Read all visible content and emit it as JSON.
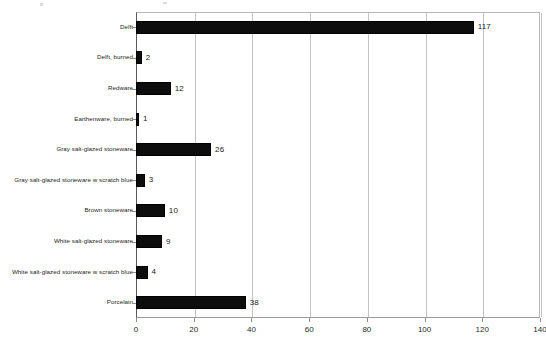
{
  "chart_data": {
    "type": "bar",
    "orientation": "horizontal",
    "title": "",
    "subtitle": "",
    "xlabel": "",
    "ylabel": "",
    "xlim": [
      0,
      140
    ],
    "xticks": [
      0,
      20,
      40,
      60,
      80,
      100,
      120,
      140
    ],
    "xtick_labels": [
      "0",
      "20",
      "40",
      "60",
      "80",
      "100",
      "120",
      "140"
    ],
    "grid": "vertical",
    "legend": "none",
    "bar_color": "#0d0d0d",
    "gridline_color": "#c4c4c4",
    "categories": [
      "Delft",
      "Delft, burned",
      "Redware",
      "Earthenware, burned",
      "Gray salt-glazed stoneware",
      "Gray salt-glazed stoneware w scratch blue",
      "Brown stoneware",
      "White salt-glazed stoneware",
      "White salt-glazed stoneware w scratch blue",
      "Porcelain"
    ],
    "values": [
      117,
      2,
      12,
      1,
      26,
      3,
      10,
      9,
      4,
      38
    ],
    "value_labels": [
      "117",
      "2",
      "12",
      "1",
      "26",
      "3",
      "10",
      "9",
      "4",
      "38"
    ]
  }
}
